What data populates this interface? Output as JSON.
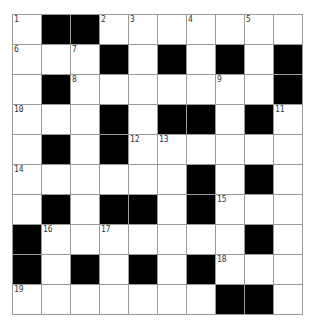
{
  "puzzle": {
    "rows": 10,
    "cols": 10,
    "colors": {
      "block": "#000000",
      "cell": "#ffffff",
      "gridline": "#9a9a9a",
      "number": "#333333"
    },
    "layout": [
      "W##WWWWWWW",
      "WWW#W#W#W#",
      "W#WWWWWWW#",
      "WWW#W##W#W",
      "W#W#WWWWWW",
      "WWWWWW#W#W",
      "W#W##W#WWW",
      "#WWWWWWW#W",
      "#W#W#W#WWW",
      "WWWWWWW##W"
    ],
    "numbers": [
      {
        "r": 0,
        "c": 0,
        "n": "1"
      },
      {
        "r": 0,
        "c": 3,
        "n": "2"
      },
      {
        "r": 0,
        "c": 4,
        "n": "3"
      },
      {
        "r": 0,
        "c": 6,
        "n": "4"
      },
      {
        "r": 0,
        "c": 8,
        "n": "5"
      },
      {
        "r": 1,
        "c": 0,
        "n": "6"
      },
      {
        "r": 1,
        "c": 2,
        "n": "7"
      },
      {
        "r": 2,
        "c": 2,
        "n": "8"
      },
      {
        "r": 2,
        "c": 7,
        "n": "9"
      },
      {
        "r": 3,
        "c": 0,
        "n": "10"
      },
      {
        "r": 3,
        "c": 9,
        "n": "11"
      },
      {
        "r": 4,
        "c": 4,
        "n": "12"
      },
      {
        "r": 4,
        "c": 5,
        "n": "13"
      },
      {
        "r": 5,
        "c": 0,
        "n": "14"
      },
      {
        "r": 6,
        "c": 7,
        "n": "15"
      },
      {
        "r": 7,
        "c": 1,
        "n": "16"
      },
      {
        "r": 7,
        "c": 3,
        "n": "17"
      },
      {
        "r": 8,
        "c": 7,
        "n": "18"
      },
      {
        "r": 9,
        "c": 0,
        "n": "19"
      }
    ]
  }
}
